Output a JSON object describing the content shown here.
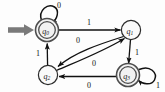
{
  "diagram": {
    "type": "state-transition-diagram",
    "alphabet": [
      "0",
      "1"
    ],
    "start_state": "q0",
    "accepting_states": [
      "q0",
      "q3"
    ],
    "states": [
      {
        "id": "q0",
        "label": "q",
        "sub": "0",
        "x": 47,
        "y": 30,
        "shape": "double-circle",
        "accepting": true,
        "start": true
      },
      {
        "id": "q1",
        "label": "q",
        "sub": "1",
        "x": 131,
        "y": 30,
        "shape": "circle",
        "accepting": false,
        "start": false
      },
      {
        "id": "q2",
        "label": "q",
        "sub": "2",
        "x": 48,
        "y": 75,
        "shape": "circle",
        "accepting": false,
        "start": false
      },
      {
        "id": "q3",
        "label": "q",
        "sub": "3",
        "x": 128,
        "y": 75,
        "shape": "double-circle",
        "accepting": true,
        "start": false
      }
    ],
    "transitions": [
      {
        "id": "t-q0-q0",
        "from": "q0",
        "to": "q0",
        "symbol": "0",
        "kind": "self-loop",
        "label_x": 59,
        "label_y": 5
      },
      {
        "id": "t-q0-q1",
        "from": "q0",
        "to": "q1",
        "symbol": "1",
        "kind": "straight",
        "label_x": 89,
        "label_y": 23
      },
      {
        "id": "t-q1-q2",
        "from": "q1",
        "to": "q2",
        "symbol": "0",
        "kind": "curve",
        "label_x": 78,
        "label_y": 40
      },
      {
        "id": "t-q2-q1",
        "from": "q2",
        "to": "q1",
        "symbol": "0",
        "kind": "curve",
        "label_x": 93,
        "label_y": 63
      },
      {
        "id": "t-q1-q3",
        "from": "q1",
        "to": "q3",
        "symbol": "1",
        "kind": "straight",
        "label_x": 137,
        "label_y": 52
      },
      {
        "id": "t-q3-q3",
        "from": "q3",
        "to": "q3",
        "symbol": "1",
        "kind": "self-loop",
        "label_x": 158,
        "label_y": 85
      },
      {
        "id": "t-q3-q2",
        "from": "q3",
        "to": "q2",
        "symbol": "0",
        "kind": "straight",
        "label_x": 89,
        "label_y": 85
      },
      {
        "id": "t-q2-q0",
        "from": "q2",
        "to": "q0",
        "symbol": "1",
        "kind": "straight",
        "label_x": 38,
        "label_y": 53
      }
    ],
    "colors": {
      "edge": "#111111",
      "node_stroke": "#2b2b2b",
      "accepting_stroke": "#4d4d4d",
      "node_fill": "#f2f2f2",
      "start_arrow": "#7a7a7a",
      "background": "#fdfdfd"
    }
  }
}
